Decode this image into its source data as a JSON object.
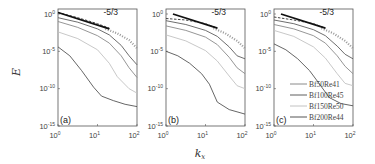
{
  "chart_data": [
    {
      "type": "line",
      "panel": "(a)",
      "xscale": "log",
      "yscale": "log",
      "xlabel": "k_x",
      "ylabel": "E",
      "xlim": [
        1,
        100
      ],
      "ylim": [
        1e-15,
        4.6
      ],
      "xticks": [
        "10^0",
        "10^1",
        "10^2"
      ],
      "yticks": [
        "10^0",
        "10^-5",
        "10^-10",
        "10^-15"
      ],
      "annotation": "-5/3",
      "reference_line": {
        "slope": "-5/3",
        "x": [
          1,
          20
        ],
        "log10_y": [
          0.2,
          -2.0
        ]
      },
      "series": [
        {
          "name": "Bf50Re41",
          "color": "#8a8a8a",
          "log10_x": [
            0,
            0.5,
            1,
            1.3,
            1.6,
            1.8,
            2
          ],
          "log10_y": [
            -1.0,
            -1.8,
            -2.9,
            -3.9,
            -5.6,
            -7.2,
            -8.5
          ]
        },
        {
          "name": "Bf100Re45",
          "color": "#5e5e5e",
          "log10_x": [
            0,
            0.5,
            1,
            1.3,
            1.6,
            1.8,
            2
          ],
          "log10_y": [
            -0.5,
            -1.1,
            -2.0,
            -2.8,
            -4.2,
            -5.6,
            -6.8
          ]
        },
        {
          "name": "Bf150Re50",
          "color": "#c2c2c2",
          "log10_x": [
            0,
            0.5,
            1,
            1.3,
            1.5,
            1.8,
            2
          ],
          "log10_y": [
            -2.4,
            -3.3,
            -4.8,
            -6.6,
            -8.4,
            -10.0,
            -10.6
          ]
        },
        {
          "name": "Bf200Re44",
          "color": "#555555",
          "log10_x": [
            0,
            0.3,
            0.6,
            0.9,
            1.1,
            1.4,
            1.7,
            2
          ],
          "log10_y": [
            -4.4,
            -5.6,
            -7.6,
            -9.8,
            -11.0,
            -11.6,
            -12.1,
            -12.4
          ]
        },
        {
          "name": "dashed",
          "color": "#444444",
          "style": "dashed",
          "log10_x": [
            0,
            0.5,
            1,
            1.3
          ],
          "log10_y": [
            0.2,
            -0.5,
            -1.3,
            -1.9
          ]
        },
        {
          "name": "dotted",
          "color": "#999999",
          "style": "dotted",
          "log10_x": [
            1.2,
            1.5,
            1.8,
            2
          ],
          "log10_y": [
            -2.0,
            -2.6,
            -3.5,
            -4.6
          ]
        }
      ]
    },
    {
      "type": "line",
      "panel": "(b)",
      "xscale": "log",
      "yscale": "log",
      "xlabel": "k_x",
      "ylabel": "",
      "xlim": [
        1,
        100
      ],
      "ylim": [
        1e-15,
        4.6
      ],
      "xticks": [
        "10^0",
        "10^1",
        "10^2"
      ],
      "yticks": [
        "10^0",
        "10^-5",
        "10^-10",
        "10^-15"
      ],
      "annotation": "-5/3",
      "reference_line": {
        "slope": "-5/3",
        "x": [
          1.5,
          20
        ],
        "log10_y": [
          0.0,
          -1.9
        ]
      },
      "series": [
        {
          "name": "Bf50Re41",
          "color": "#8a8a8a",
          "log10_x": [
            0,
            0.5,
            1,
            1.3,
            1.6,
            1.8,
            2
          ],
          "log10_y": [
            -1.6,
            -2.2,
            -3.1,
            -4.1,
            -5.8,
            -7.2,
            -8.0
          ]
        },
        {
          "name": "Bf100Re45",
          "color": "#5e5e5e",
          "log10_x": [
            0,
            0.5,
            1,
            1.3,
            1.6,
            1.8,
            2
          ],
          "log10_y": [
            -0.9,
            -1.4,
            -2.2,
            -3.0,
            -4.4,
            -5.6,
            -6.0
          ]
        },
        {
          "name": "Bf150Re50",
          "color": "#c2c2c2",
          "log10_x": [
            0,
            0.5,
            1,
            1.3,
            1.6,
            1.8,
            2
          ],
          "log10_y": [
            -2.8,
            -3.6,
            -4.9,
            -6.3,
            -8.3,
            -9.6,
            -10.0
          ]
        },
        {
          "name": "Bf200Re44",
          "color": "#555555",
          "log10_x": [
            0,
            0.3,
            0.6,
            0.9,
            1.1,
            1.3,
            1.6,
            2
          ],
          "log10_y": [
            -5.0,
            -5.6,
            -6.6,
            -8.0,
            -9.4,
            -11.8,
            -12.8,
            -13.4
          ]
        },
        {
          "name": "dashed",
          "color": "#444444",
          "style": "dashed",
          "log10_x": [
            0,
            0.5,
            1,
            1.3
          ],
          "log10_y": [
            -0.6,
            -0.8,
            -1.3,
            -1.9
          ]
        },
        {
          "name": "dotted",
          "color": "#999999",
          "style": "dotted",
          "log10_x": [
            1.2,
            1.5,
            1.8,
            2
          ],
          "log10_y": [
            -1.9,
            -2.6,
            -3.6,
            -4.6
          ]
        }
      ]
    },
    {
      "type": "line",
      "panel": "(c)",
      "xscale": "log",
      "yscale": "log",
      "xlabel": "k_x",
      "ylabel": "",
      "xlim": [
        1,
        100
      ],
      "ylim": [
        1e-15,
        4.6
      ],
      "xticks": [
        "10^0",
        "10^1",
        "10^2"
      ],
      "yticks": [
        "10^0",
        "10^-5",
        "10^-10",
        "10^-15"
      ],
      "annotation": "-5/3",
      "reference_line": {
        "slope": "-5/3",
        "x": [
          1.5,
          20
        ],
        "log10_y": [
          0.0,
          -1.9
        ]
      },
      "legend": {
        "position": "lower right",
        "entries": [
          "Bf50Re41",
          "Bf100Re45",
          "Bf150Re50",
          "Bf200Re44"
        ]
      },
      "series": [
        {
          "name": "Bf50Re41",
          "color": "#8a8a8a",
          "log10_x": [
            0,
            0.5,
            1,
            1.3,
            1.6,
            1.8,
            2
          ],
          "log10_y": [
            -1.4,
            -2.0,
            -2.9,
            -3.9,
            -5.6,
            -7.0,
            -8.0
          ]
        },
        {
          "name": "Bf100Re45",
          "color": "#5e5e5e",
          "log10_x": [
            0,
            0.5,
            1,
            1.3,
            1.6,
            1.8,
            2
          ],
          "log10_y": [
            -0.8,
            -1.3,
            -2.1,
            -2.9,
            -4.3,
            -5.4,
            -6.0
          ]
        },
        {
          "name": "Bf150Re50",
          "color": "#c2c2c2",
          "log10_x": [
            0,
            0.5,
            1,
            1.3,
            1.6,
            1.8,
            2
          ],
          "log10_y": [
            -2.2,
            -3.0,
            -4.4,
            -5.9,
            -8.0,
            -9.3,
            -9.6
          ]
        },
        {
          "name": "Bf200Re44",
          "color": "#555555",
          "log10_x": [
            0,
            0.3,
            0.6,
            0.9,
            1.1,
            1.4,
            1.7,
            2
          ],
          "log10_y": [
            -4.0,
            -4.8,
            -6.0,
            -7.6,
            -9.0,
            -11.2,
            -12.0,
            -12.3
          ]
        },
        {
          "name": "dashed",
          "color": "#444444",
          "style": "dashed",
          "log10_x": [
            0,
            0.5,
            1,
            1.3
          ],
          "log10_y": [
            -0.4,
            -0.8,
            -1.3,
            -1.9
          ]
        },
        {
          "name": "dotted",
          "color": "#999999",
          "style": "dotted",
          "log10_x": [
            1.2,
            1.5,
            1.8,
            2
          ],
          "log10_y": [
            -1.9,
            -2.6,
            -3.6,
            -4.6
          ]
        }
      ]
    }
  ],
  "figure": {
    "ylabel": "E",
    "xlabel_main": "k",
    "xlabel_sub": "x",
    "panels": [
      {
        "label": "(a)",
        "left": 58
      },
      {
        "label": "(b)",
        "left": 166
      },
      {
        "label": "(c)",
        "left": 274
      }
    ],
    "slope_label": "-5/3",
    "ytick_bases": [
      "10",
      "10",
      "10",
      "10"
    ],
    "ytick_exps": [
      "0",
      "-5",
      "-10",
      "-15"
    ],
    "xtick_bases": [
      "10",
      "10",
      "10"
    ],
    "xtick_exps": [
      "0",
      "1",
      "2"
    ],
    "legend": [
      "Bf50Re41",
      "Bf100Re45",
      "Bf150Re50",
      "Bf200Re44"
    ]
  }
}
